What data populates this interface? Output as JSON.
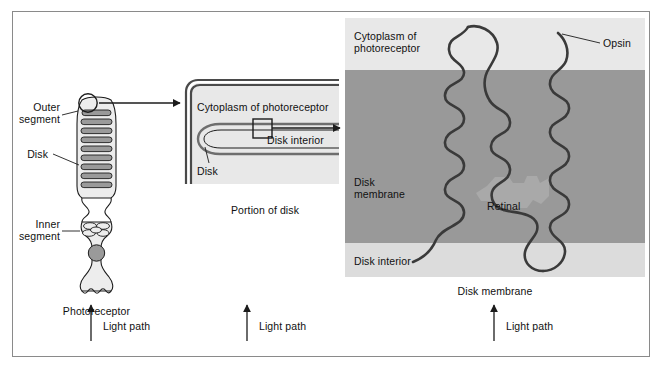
{
  "figure": {
    "panels": [
      {
        "id": "photoreceptor",
        "caption": "Photoreceptor"
      },
      {
        "id": "portion-of-disk",
        "caption": "Portion of disk"
      },
      {
        "id": "disk-membrane",
        "caption": "Disk membrane"
      }
    ]
  },
  "panel_cell": {
    "caption": "Photoreceptor",
    "labels": {
      "outer_segment": "Outer\nsegment",
      "outer_segment_line1": "Outer",
      "outer_segment_line2": "segment",
      "disk": "Disk",
      "inner_segment": "Inner\nsegment",
      "inner_segment_line1": "Inner",
      "inner_segment_line2": "segment"
    }
  },
  "panel_disk": {
    "caption": "Portion of disk",
    "labels": {
      "cytoplasm": "Cytoplasm of photoreceptor",
      "disk_interior": "Disk interior",
      "disk": "Disk"
    }
  },
  "panel_membrane": {
    "caption": "Disk membrane",
    "labels": {
      "cytoplasm": "Cytoplasm of\nphotoreceptor",
      "cytoplasm_line1": "Cytoplasm of",
      "cytoplasm_line2": "photoreceptor",
      "opsin": "Opsin",
      "disk_membrane": "Disk\nmembrane",
      "disk_membrane_line1": "Disk",
      "disk_membrane_line2": "membrane",
      "retinal": "Retinal",
      "disk_interior": "Disk interior"
    }
  },
  "light_paths": [
    {
      "label": "Light path"
    },
    {
      "label": "Light path"
    },
    {
      "label": "Light path"
    }
  ],
  "colors": {
    "page_background": "#ffffff",
    "frame_border": "#8a8a8a",
    "cytosol_fill": "#e8e8e8",
    "membrane_dark": "#999999",
    "membrane_light": "#dcdcdc",
    "retinal_fill": "#a9a9a9",
    "disk_lumen_fill": "#8f8f8f",
    "cell_fill": "#ededed",
    "disk_stack_fill": "#9a9a9a",
    "stroke": "#1c1c1c",
    "text": "#111111"
  }
}
